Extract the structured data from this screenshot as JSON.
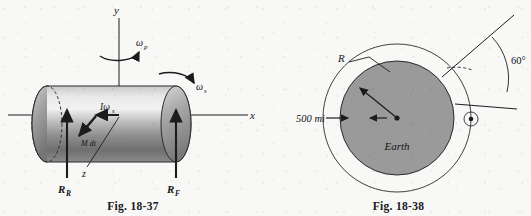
{
  "page": {
    "background_color": "#f8f8f7",
    "ink_color": "#1c1c1c",
    "earth_fill_color": "#9a9a9a"
  },
  "figures": [
    {
      "id": "fig-18-37",
      "caption": "Fig. 18-37",
      "subject": "gyroscopic rotor on shaft with bearing reactions",
      "labels": {
        "axis_y": "y",
        "axis_x": "x",
        "axis_z": "z",
        "omega_precession": "ω",
        "omega_precession_sub": "p",
        "omega_spin": "ω",
        "omega_spin_sub": "s",
        "angular_momentum": "Iω",
        "angular_momentum_sub": "s",
        "moment_impulse": "M dt",
        "reaction_rear": "R",
        "reaction_rear_sub": "R",
        "reaction_front": "R",
        "reaction_front_sub": "F"
      }
    },
    {
      "id": "fig-18-38",
      "caption": "Fig. 18-38",
      "subject": "satellite orbit 500 mi above Earth with 60 degree angle",
      "labels": {
        "radius": "R",
        "altitude": "500 mi",
        "body": "Earth",
        "angle": "60°"
      },
      "values": {
        "altitude_number": 500,
        "altitude_unit": "mi",
        "angle_degrees": 60
      }
    }
  ]
}
